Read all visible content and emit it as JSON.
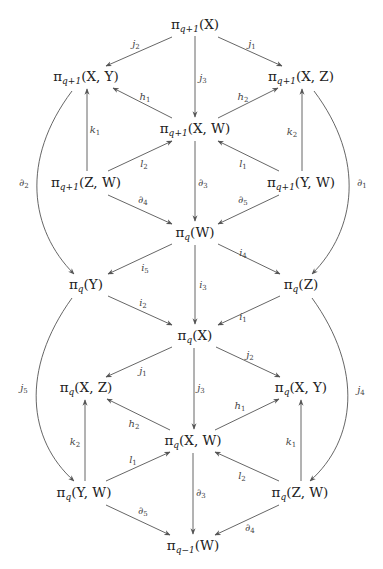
{
  "diagram": {
    "type": "commutative-diagram",
    "colors": {
      "line": "#555555",
      "text": "#222222",
      "label": "#444444",
      "background": "#ffffff"
    },
    "nodes": [
      {
        "id": "n1",
        "base": "π",
        "sub": "q+1",
        "arg": "(X)",
        "x": 195,
        "y": 25
      },
      {
        "id": "n2",
        "base": "π",
        "sub": "q+1",
        "arg": "(X, Y)",
        "x": 86,
        "y": 77
      },
      {
        "id": "n3",
        "base": "π",
        "sub": "q+1",
        "arg": "(X, Z)",
        "x": 301,
        "y": 77
      },
      {
        "id": "n4",
        "base": "π",
        "sub": "q+1",
        "arg": "(X, W)",
        "x": 195,
        "y": 129
      },
      {
        "id": "n5",
        "base": "π",
        "sub": "q+1",
        "arg": "(Z, W)",
        "x": 86,
        "y": 183
      },
      {
        "id": "n6",
        "base": "π",
        "sub": "q+1",
        "arg": "(Y, W)",
        "x": 301,
        "y": 183
      },
      {
        "id": "n7",
        "base": "π",
        "sub": "q",
        "arg": "(W)",
        "x": 195,
        "y": 233
      },
      {
        "id": "n8",
        "base": "π",
        "sub": "q",
        "arg": "(Y)",
        "x": 86,
        "y": 285
      },
      {
        "id": "n9",
        "base": "π",
        "sub": "q",
        "arg": "(Z)",
        "x": 301,
        "y": 285
      },
      {
        "id": "n10",
        "base": "π",
        "sub": "q",
        "arg": "(X)",
        "x": 195,
        "y": 336
      },
      {
        "id": "n11",
        "base": "π",
        "sub": "q",
        "arg": "(X, Z)",
        "x": 86,
        "y": 388
      },
      {
        "id": "n12",
        "base": "π",
        "sub": "q",
        "arg": "(X, Y)",
        "x": 301,
        "y": 388
      },
      {
        "id": "n13",
        "base": "π",
        "sub": "q",
        "arg": "(X, W)",
        "x": 193,
        "y": 441
      },
      {
        "id": "n14",
        "base": "π",
        "sub": "q",
        "arg": "(Y, W)",
        "x": 84,
        "y": 493
      },
      {
        "id": "n15",
        "base": "π",
        "sub": "q",
        "arg": "(Z, W)",
        "x": 300,
        "y": 493
      },
      {
        "id": "n16",
        "base": "π",
        "sub": "q−1",
        "arg": "(W)",
        "x": 193,
        "y": 546
      }
    ],
    "labels": [
      {
        "id": "l_j2_top",
        "base": "j",
        "sub": "2",
        "x": 136,
        "y": 44
      },
      {
        "id": "l_j1_top",
        "base": "j",
        "sub": "1",
        "x": 252,
        "y": 44
      },
      {
        "id": "l_j3_top",
        "base": "j",
        "sub": "3",
        "x": 203,
        "y": 78
      },
      {
        "id": "l_h1_top",
        "base": "h",
        "sub": "1",
        "x": 145,
        "y": 97
      },
      {
        "id": "l_h2_top",
        "base": "h",
        "sub": "2",
        "x": 243,
        "y": 97
      },
      {
        "id": "l_k1_top",
        "base": "k",
        "sub": "1",
        "x": 95,
        "y": 130
      },
      {
        "id": "l_k2_top",
        "base": "k",
        "sub": "2",
        "x": 292,
        "y": 132
      },
      {
        "id": "l_l2_top",
        "base": "l",
        "sub": "2",
        "x": 144,
        "y": 164
      },
      {
        "id": "l_l1_top",
        "base": "l",
        "sub": "1",
        "x": 243,
        "y": 164
      },
      {
        "id": "l_d2_top",
        "base": "∂",
        "sub": "2",
        "x": 24,
        "y": 183
      },
      {
        "id": "l_d1_top",
        "base": "∂",
        "sub": "1",
        "x": 362,
        "y": 183
      },
      {
        "id": "l_d3_top",
        "base": "∂",
        "sub": "3",
        "x": 203,
        "y": 183
      },
      {
        "id": "l_d4_top",
        "base": "∂",
        "sub": "4",
        "x": 143,
        "y": 200
      },
      {
        "id": "l_d5_top",
        "base": "∂",
        "sub": "5",
        "x": 243,
        "y": 200
      },
      {
        "id": "l_i5",
        "base": "i",
        "sub": "5",
        "x": 145,
        "y": 268
      },
      {
        "id": "l_i4",
        "base": "i",
        "sub": "4",
        "x": 243,
        "y": 253
      },
      {
        "id": "l_i3",
        "base": "i",
        "sub": "3",
        "x": 203,
        "y": 285
      },
      {
        "id": "l_i2",
        "base": "i",
        "sub": "2",
        "x": 143,
        "y": 303
      },
      {
        "id": "l_i1",
        "base": "i",
        "sub": "1",
        "x": 243,
        "y": 317
      },
      {
        "id": "l_j1_bot",
        "base": "j",
        "sub": "1",
        "x": 143,
        "y": 371
      },
      {
        "id": "l_j2_bot",
        "base": "j",
        "sub": "2",
        "x": 250,
        "y": 355
      },
      {
        "id": "l_j3_bot",
        "base": "j",
        "sub": "3",
        "x": 201,
        "y": 388
      },
      {
        "id": "l_j5",
        "base": "j",
        "sub": "5",
        "x": 24,
        "y": 388
      },
      {
        "id": "l_j4",
        "base": "j",
        "sub": "4",
        "x": 361,
        "y": 390
      },
      {
        "id": "l_h2_bot",
        "base": "h",
        "sub": "2",
        "x": 134,
        "y": 424
      },
      {
        "id": "l_h1_bot",
        "base": "h",
        "sub": "1",
        "x": 240,
        "y": 406
      },
      {
        "id": "l_k2_bot",
        "base": "k",
        "sub": "2",
        "x": 75,
        "y": 442
      },
      {
        "id": "l_k1_bot",
        "base": "k",
        "sub": "1",
        "x": 291,
        "y": 442
      },
      {
        "id": "l_l1_bot",
        "base": "l",
        "sub": "1",
        "x": 133,
        "y": 460
      },
      {
        "id": "l_l2_bot",
        "base": "l",
        "sub": "2",
        "x": 242,
        "y": 476
      },
      {
        "id": "l_d3_bot",
        "base": "∂",
        "sub": "3",
        "x": 201,
        "y": 493
      },
      {
        "id": "l_d5_bot",
        "base": "∂",
        "sub": "5",
        "x": 143,
        "y": 511
      },
      {
        "id": "l_d4_bot",
        "base": "∂",
        "sub": "4",
        "x": 250,
        "y": 528
      }
    ],
    "edges": [
      {
        "from": "n1",
        "to": "n2",
        "d": "M172,37 L106,66"
      },
      {
        "from": "n1",
        "to": "n3",
        "d": "M218,37 L282,66"
      },
      {
        "from": "n1",
        "to": "n4",
        "d": "M195,36 L195,117"
      },
      {
        "from": "n4",
        "to": "n2",
        "d": "M172,118 L113,88"
      },
      {
        "from": "n4",
        "to": "n3",
        "d": "M218,118 L278,88"
      },
      {
        "from": "n5",
        "to": "n2",
        "d": "M87,171 L87,89"
      },
      {
        "from": "n6",
        "to": "n3",
        "d": "M302,171 L302,89"
      },
      {
        "from": "n5",
        "to": "n4",
        "d": "M108,171 L172,141"
      },
      {
        "from": "n6",
        "to": "n4",
        "d": "M279,171 L218,141"
      },
      {
        "from": "n4",
        "to": "n7",
        "d": "M195,141 L195,221"
      },
      {
        "from": "n5",
        "to": "n7",
        "d": "M108,195 L172,224"
      },
      {
        "from": "n6",
        "to": "n7",
        "d": "M279,195 L218,224"
      },
      {
        "from": "n2",
        "to": "n8",
        "d": "M72,91 C20,160 30,230 74,274"
      },
      {
        "from": "n3",
        "to": "n9",
        "d": "M314,91 C366,160 356,230 312,274"
      },
      {
        "from": "n7",
        "to": "n8",
        "d": "M172,244 L108,274"
      },
      {
        "from": "n7",
        "to": "n9",
        "d": "M218,244 L280,274"
      },
      {
        "from": "n7",
        "to": "n10",
        "d": "M195,245 L195,324"
      },
      {
        "from": "n8",
        "to": "n10",
        "d": "M108,296 L172,325"
      },
      {
        "from": "n9",
        "to": "n10",
        "d": "M280,296 L218,325"
      },
      {
        "from": "n10",
        "to": "n11",
        "d": "M172,347 L106,377"
      },
      {
        "from": "n10",
        "to": "n12",
        "d": "M216,347 L280,377"
      },
      {
        "from": "n10",
        "to": "n13",
        "d": "M194,348 L194,429"
      },
      {
        "from": "n13",
        "to": "n11",
        "d": "M170,430 L107,399"
      },
      {
        "from": "n13",
        "to": "n12",
        "d": "M215,430 L279,399"
      },
      {
        "from": "n14",
        "to": "n11",
        "d": "M85,481 L85,400"
      },
      {
        "from": "n15",
        "to": "n12",
        "d": "M301,481 L301,400"
      },
      {
        "from": "n14",
        "to": "n13",
        "d": "M106,481 L170,452"
      },
      {
        "from": "n15",
        "to": "n13",
        "d": "M279,481 L215,452"
      },
      {
        "from": "n13",
        "to": "n16",
        "d": "M193,453 L193,534"
      },
      {
        "from": "n14",
        "to": "n16",
        "d": "M106,505 L170,535"
      },
      {
        "from": "n15",
        "to": "n16",
        "d": "M279,505 L215,535"
      },
      {
        "from": "n8",
        "to": "n14",
        "d": "M72,298 C20,370 28,440 74,481"
      },
      {
        "from": "n9",
        "to": "n15",
        "d": "M312,298 C364,370 356,440 310,481"
      }
    ]
  }
}
